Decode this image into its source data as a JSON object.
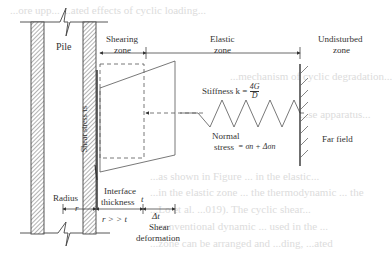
{
  "diagram": {
    "labels": {
      "pile": "Pile",
      "shearing_zone_l1": "Shearing",
      "shearing_zone_l2": "zone",
      "elastic_zone_l1": "Elastic",
      "elastic_zone_l2": "zone",
      "undisturbed_zone_l1": "Undisturbed",
      "undisturbed_zone_l2": "zone",
      "stiffness": "Stiffness k = ",
      "stiffness_num": "4G",
      "stiffness_den": "D",
      "normal_stress_l1": "Normal",
      "normal_stress_l2": "stress",
      "normal_stress_expr": "= σn + Δσn",
      "shear_stress": "Shear stress τs",
      "far_field": "Far field",
      "radius": "Radius",
      "r": "r",
      "interface_l1": "Interface",
      "interface_l2": "thickness",
      "t": "t",
      "r_gg_t": "r > > t",
      "delta_t": "Δt",
      "shear_def_l1": "Shear",
      "shear_def_l2": "deformation"
    },
    "background_text": [
      "...ore upp... ...ated effects of cyclic loading...",
      "...mechanism of cyclic degradation...",
      "...se apparatus...",
      "...as shown in Figure ... in the elastic...",
      "...in the elastic zone ... the thermodynamic ... the",
      "...Lo et al. ...019). The cyclic shear...",
      "...conventional dynamic ... used in the ...",
      "...zone can be arranged and ...ding, ...ated"
    ]
  }
}
